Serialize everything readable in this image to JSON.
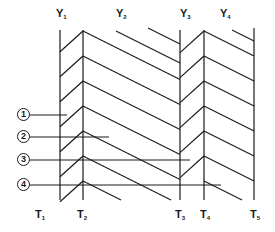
{
  "diagram": {
    "top_labels": [
      {
        "id": "Y1",
        "letter": "Y",
        "sub": "1",
        "x": 60,
        "y": 8
      },
      {
        "id": "Y2",
        "letter": "Y",
        "sub": "2",
        "x": 120,
        "y": 8
      },
      {
        "id": "Y3",
        "letter": "Y",
        "sub": "3",
        "x": 184,
        "y": 8
      },
      {
        "id": "Y4",
        "letter": "Y",
        "sub": "4",
        "x": 224,
        "y": 8
      }
    ],
    "bottom_labels": [
      {
        "id": "T1",
        "letter": "T",
        "sub": "1",
        "x": 39,
        "y": 209
      },
      {
        "id": "T2",
        "letter": "T",
        "sub": "2",
        "x": 81,
        "y": 209
      },
      {
        "id": "T3",
        "letter": "T",
        "sub": "3",
        "x": 179,
        "y": 209
      },
      {
        "id": "T4",
        "letter": "T",
        "sub": "4",
        "x": 204,
        "y": 209
      },
      {
        "id": "T5",
        "letter": "T",
        "sub": "5",
        "x": 254,
        "y": 209
      }
    ],
    "markers": [
      {
        "id": "1",
        "label": "1",
        "y": 115,
        "line_end_x": 67
      },
      {
        "id": "2",
        "label": "2",
        "y": 137,
        "line_end_x": 109
      },
      {
        "id": "3",
        "label": "3",
        "y": 160,
        "line_end_x": 190
      },
      {
        "id": "4",
        "label": "4",
        "y": 185,
        "line_end_x": 221
      }
    ],
    "stroke_color": "#1a1a1a",
    "background_color": "#ffffff"
  }
}
